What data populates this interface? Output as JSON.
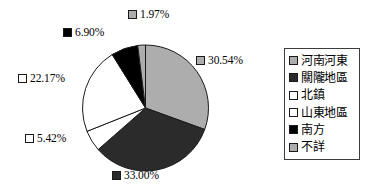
{
  "chart_data": {
    "type": "pie",
    "title": "",
    "subtitle": "",
    "xlabel": "",
    "ylabel": "",
    "legend_position": "right",
    "grid": false,
    "categories": [
      "河南河東",
      "關隴地區",
      "北鎮",
      "山東地區",
      "南方",
      "不詳"
    ],
    "values": [
      30.54,
      33.0,
      5.42,
      22.17,
      6.9,
      1.97
    ],
    "value_labels": [
      "30.54%",
      "33.00%",
      "5.42%",
      "22.17%",
      "6.90%",
      "1.97%"
    ],
    "colors": [
      "#adadad",
      "#2b2b2b",
      "#ffffff",
      "#ffffff",
      "#000000",
      "#adadad"
    ],
    "slices": [
      {
        "name": "河南河東",
        "value": 30.54,
        "label": "30.54%",
        "color": "#adadad",
        "swatch": "gray"
      },
      {
        "name": "關隴地區",
        "value": 33.0,
        "label": "33.00%",
        "color": "#2b2b2b",
        "swatch": "dark"
      },
      {
        "name": "北鎮",
        "value": 5.42,
        "label": "5.42%",
        "color": "#ffffff",
        "swatch": "white"
      },
      {
        "name": "山東地區",
        "value": 22.17,
        "label": "22.17%",
        "color": "#ffffff",
        "swatch": "white"
      },
      {
        "name": "南方",
        "value": 6.9,
        "label": "6.90%",
        "color": "#000000",
        "swatch": "black"
      },
      {
        "name": "不詳",
        "value": 1.97,
        "label": "1.97%",
        "color": "#adadad",
        "swatch": "gray"
      }
    ]
  },
  "legend": {
    "items": [
      {
        "label": "河南河東",
        "swatch": "gray"
      },
      {
        "label": "關隴地區",
        "swatch": "dark"
      },
      {
        "label": "北鎮",
        "swatch": "white"
      },
      {
        "label": "山東地區",
        "swatch": "white"
      },
      {
        "label": "南方",
        "swatch": "black"
      },
      {
        "label": "不詳",
        "swatch": "gray"
      }
    ]
  },
  "colors": {
    "slice_gray": "#adadad",
    "slice_dark": "#2b2b2b",
    "slice_white": "#ffffff",
    "slice_black": "#000000",
    "outline": "#1a1a1a",
    "legend_border": "#3d3d3d",
    "background": "#ffffff"
  }
}
